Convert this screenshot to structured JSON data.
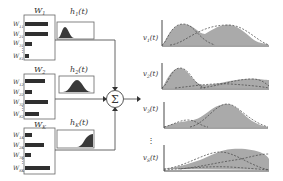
{
  "colors": {
    "line": "#555555",
    "bar": "#2f2f2f",
    "fill": "#a9a9a9",
    "dash": "#4a4a4a",
    "box": "#666666"
  },
  "weights": [
    {
      "title": "W1",
      "title_main": "W",
      "title_sub": "1",
      "rows": [
        {
          "label_main": "W",
          "label_sub": "11",
          "value": 0.95
        },
        {
          "label_main": "W",
          "label_sub": "21",
          "value": 0.95
        },
        {
          "label_main": "W",
          "label_sub": "31",
          "value": 0.3
        },
        {
          "label_main": "W",
          "label_sub": "S1",
          "value": 0.15
        }
      ]
    },
    {
      "title": "W2",
      "title_main": "W",
      "title_sub": "2",
      "rows": [
        {
          "label_main": "W",
          "label_sub": "12",
          "value": 0.85
        },
        {
          "label_main": "W",
          "label_sub": "22",
          "value": 0.3
        },
        {
          "label_main": "W",
          "label_sub": "32",
          "value": 0.95
        },
        {
          "label_main": "W",
          "label_sub": "S2",
          "value": 0.55
        }
      ]
    },
    {
      "title": "WK",
      "title_main": "W",
      "title_sub": "K",
      "rows": [
        {
          "label_main": "W",
          "label_sub": "1K",
          "value": 0.3
        },
        {
          "label_main": "W",
          "label_sub": "2K",
          "value": 0.8
        },
        {
          "label_main": "W",
          "label_sub": "3K",
          "value": 0.25
        },
        {
          "label_main": "W",
          "label_sub": "SK",
          "value": 1.0
        }
      ]
    }
  ],
  "kernels": [
    {
      "label_main": "h",
      "label_sub": "1",
      "label_arg": "(t)",
      "shape": "early-peak"
    },
    {
      "label_main": "h",
      "label_sub": "2",
      "label_arg": "(t)",
      "shape": "mid-peak"
    },
    {
      "label_main": "h",
      "label_sub": "K",
      "label_arg": "(t)",
      "shape": "late-rise"
    }
  ],
  "sum_node": {
    "symbol": "Σ"
  },
  "outputs": [
    {
      "label_main": "v",
      "label_sub": "1",
      "label_arg": "(t)"
    },
    {
      "label_main": "v",
      "label_sub": "2",
      "label_arg": "(t)"
    },
    {
      "label_main": "v",
      "label_sub": "3",
      "label_arg": "(t)"
    },
    {
      "label_main": "v",
      "label_sub": "S",
      "label_arg": "(t)"
    }
  ],
  "ellipsis": "⋮"
}
